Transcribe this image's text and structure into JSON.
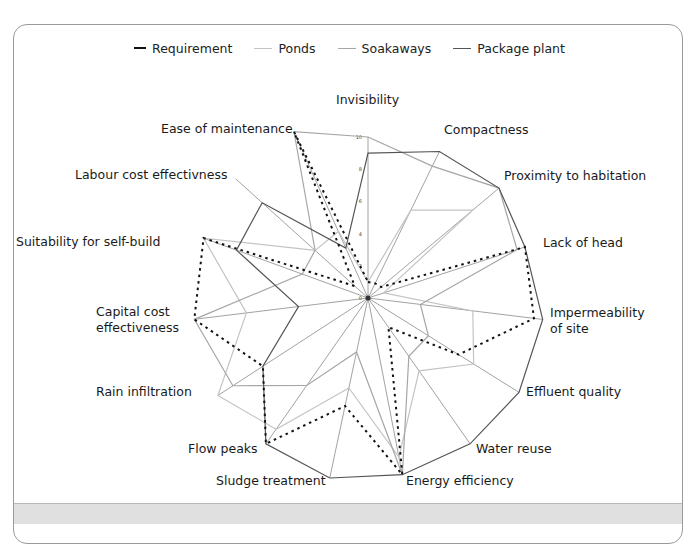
{
  "legend": {
    "items": [
      {
        "label": "Requirement",
        "style": "dotted",
        "color": "#111111"
      },
      {
        "label": "Ponds",
        "style": "solid",
        "color": "#c4c4c4"
      },
      {
        "label": "Soakaways",
        "style": "solid",
        "color": "#a6a6a6"
      },
      {
        "label": "Package plant",
        "style": "solid",
        "color": "#555555"
      }
    ]
  },
  "chart_data": {
    "type": "radar",
    "title": "",
    "center": [
      368,
      298
    ],
    "scale": {
      "min": 0,
      "max": 10,
      "ticks": [
        0,
        2,
        4,
        6,
        8,
        10
      ]
    },
    "axes": [
      {
        "label": "Invisibility",
        "angle": 0,
        "r": 161,
        "lx": 336,
        "ly": 92,
        "ex": 368,
        "ey": 137
      },
      {
        "label": "Compactness",
        "angle": 26,
        "r": 163,
        "lx": 444,
        "ly": 122,
        "ex": 440,
        "ey": 152
      },
      {
        "label": "Proximity to habitation",
        "angle": 50,
        "r": 171,
        "lx": 504,
        "ly": 168,
        "ex": 498,
        "ey": 180
      },
      {
        "label": "Lack of head",
        "angle": 72,
        "r": 165,
        "lx": 543,
        "ly": 235,
        "ex": 525,
        "ey": 243
      },
      {
        "label": "Impermeability\nof site",
        "angle": 97,
        "r": 176,
        "lx": 550,
        "ly": 305,
        "ex": 543,
        "ey": 318
      },
      {
        "label": "Effluent quality",
        "angle": 122,
        "r": 178,
        "lx": 526,
        "ly": 384,
        "ex": 519,
        "ey": 390
      },
      {
        "label": "Water reuse",
        "angle": 145,
        "r": 178,
        "lx": 476,
        "ly": 441,
        "ex": 470,
        "ey": 440
      },
      {
        "label": "Energy efficiency",
        "angle": 169,
        "r": 180,
        "lx": 406,
        "ly": 473,
        "ex": 402,
        "ey": 475
      },
      {
        "label": "Sludge treatment",
        "angle": 192,
        "r": 184,
        "lx": 216,
        "ly": 473,
        "ex": 330,
        "ey": 478
      },
      {
        "label": "Flow peaks",
        "angle": 215,
        "r": 178,
        "lx": 188,
        "ly": 441,
        "ex": 265,
        "ey": 442
      },
      {
        "label": "Rain infiltration",
        "angle": 237,
        "r": 179,
        "lx": 96,
        "ly": 384,
        "ex": 217,
        "ey": 390
      },
      {
        "label": "Capital cost\neffectiveness",
        "angle": 263,
        "r": 175,
        "lx": 96,
        "ly": 304,
        "ex": 194,
        "ey": 318
      },
      {
        "label": "Suitability for self-build",
        "angle": 290,
        "r": 175,
        "lx": 16,
        "ly": 234,
        "ex": 203,
        "ey": 243
      },
      {
        "label": "Labour cost effectivness",
        "angle": 312,
        "r": 178,
        "lx": 75,
        "ly": 167,
        "ex": 239,
        "ey": 180
      },
      {
        "label": "Ease of maintenance",
        "angle": 336,
        "r": 182,
        "lx": 161,
        "ly": 121,
        "ex": 298,
        "ey": 132
      }
    ],
    "series": [
      {
        "name": "Requirement",
        "style": "dotted",
        "color": "#111111",
        "values": [
          1,
          1,
          1,
          10,
          9.5,
          6,
          2,
          10,
          6,
          10,
          7,
          10,
          10,
          1,
          10
        ]
      },
      {
        "name": "Ponds",
        "style": "solid",
        "color": "#c4c4c4",
        "values": [
          1,
          6,
          8,
          1,
          6,
          7,
          5,
          9,
          5,
          9,
          10,
          7,
          10,
          4,
          4
        ]
      },
      {
        "name": "Soakaways",
        "style": "solid",
        "color": "#a6a6a6",
        "values": [
          10,
          9,
          10,
          9.5,
          3,
          4,
          4,
          10,
          3,
          6,
          9,
          10,
          4,
          4,
          10
        ]
      },
      {
        "name": "Package plant",
        "style": "solid",
        "color": "#555555",
        "values": [
          9,
          10,
          10,
          10,
          10,
          10,
          10,
          10,
          10,
          10,
          7,
          4,
          8,
          8,
          3
        ]
      }
    ]
  }
}
